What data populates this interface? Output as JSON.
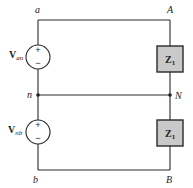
{
  "diagram": {
    "type": "circuit",
    "nodes": {
      "a": "a",
      "A": "A",
      "n": "n",
      "N": "N",
      "b": "b",
      "B": "B"
    },
    "sources": [
      {
        "id": "source-an",
        "label": "V",
        "subscript": "an",
        "plus": "+",
        "minus": "−"
      },
      {
        "id": "source-nb",
        "label": "V",
        "subscript": "nb",
        "plus": "+",
        "minus": "−"
      }
    ],
    "impedances": [
      {
        "id": "z1-top",
        "label": "Z",
        "subscript": "1"
      },
      {
        "id": "z1-bottom",
        "label": "Z",
        "subscript": "1"
      }
    ],
    "colors": {
      "wire": "#2a2a2a",
      "impedance_fill": "#c9c9c9",
      "background": "#ffffff"
    }
  }
}
